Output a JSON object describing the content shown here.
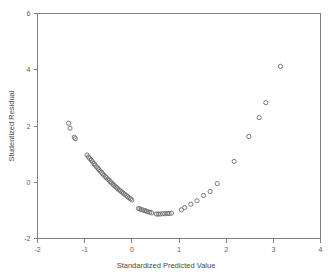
{
  "chart_data": {
    "type": "scatter",
    "title": "",
    "xlabel": "Standardized Predicted Value",
    "ylabel": "Studentized Residual",
    "xlim": [
      -2,
      4
    ],
    "ylim": [
      -2,
      6
    ],
    "xticks": [
      -2,
      -1,
      0,
      1,
      2,
      3,
      4
    ],
    "xticklabels": [
      "-2",
      "-1",
      "0",
      "1",
      "2",
      "3",
      "4"
    ],
    "yticks": [
      -2,
      0,
      2,
      4,
      6
    ],
    "yticklabels": [
      "-2",
      "0",
      "2",
      "4",
      "6"
    ],
    "grid": false,
    "legend": null,
    "marker": {
      "shape": "open-circle",
      "radius_px": 2.1,
      "stroke_color": "#6b6b6b",
      "fill": "none"
    },
    "series": [
      {
        "name": "residuals",
        "x": [
          -1.34,
          -1.31,
          -1.22,
          -1.2,
          -0.95,
          -0.92,
          -0.89,
          -0.86,
          -0.83,
          -0.8,
          -0.78,
          -0.75,
          -0.72,
          -0.7,
          -0.67,
          -0.64,
          -0.62,
          -0.59,
          -0.56,
          -0.54,
          -0.51,
          -0.48,
          -0.46,
          -0.43,
          -0.4,
          -0.38,
          -0.35,
          -0.32,
          -0.3,
          -0.27,
          -0.24,
          -0.21,
          -0.18,
          -0.15,
          -0.12,
          -0.09,
          -0.06,
          -0.03,
          0.0,
          0.14,
          0.17,
          0.2,
          0.24,
          0.28,
          0.31,
          0.34,
          0.38,
          0.42,
          0.52,
          0.56,
          0.6,
          0.65,
          0.7,
          0.75,
          0.79,
          0.84,
          1.05,
          1.12,
          1.25,
          1.38,
          1.52,
          1.66,
          1.81,
          2.17,
          2.48,
          2.7,
          2.84,
          3.15
        ],
        "y": [
          2.1,
          1.92,
          1.6,
          1.55,
          0.97,
          0.9,
          0.84,
          0.78,
          0.72,
          0.66,
          0.61,
          0.55,
          0.5,
          0.45,
          0.4,
          0.35,
          0.3,
          0.25,
          0.2,
          0.16,
          0.11,
          0.07,
          0.02,
          -0.02,
          -0.07,
          -0.11,
          -0.15,
          -0.19,
          -0.23,
          -0.27,
          -0.31,
          -0.35,
          -0.39,
          -0.43,
          -0.47,
          -0.51,
          -0.55,
          -0.59,
          -0.63,
          -0.93,
          -0.95,
          -0.97,
          -0.99,
          -1.01,
          -1.03,
          -1.05,
          -1.07,
          -1.09,
          -1.13,
          -1.13,
          -1.13,
          -1.12,
          -1.12,
          -1.11,
          -1.11,
          -1.1,
          -0.98,
          -0.9,
          -0.78,
          -0.66,
          -0.47,
          -0.33,
          -0.05,
          0.74,
          1.63,
          2.3,
          2.83,
          4.12
        ]
      }
    ]
  },
  "axes": {
    "x_title": "Standardized Predicted Value",
    "y_title": "Studentized Residual"
  }
}
